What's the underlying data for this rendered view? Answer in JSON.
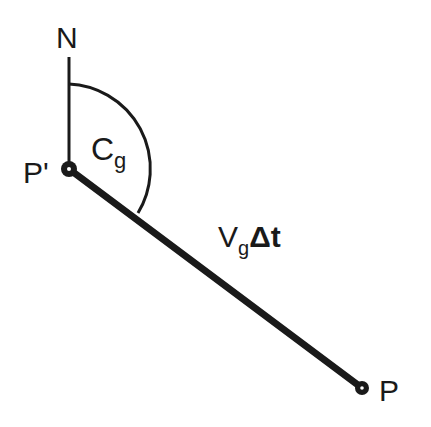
{
  "diagram": {
    "north_label": "N",
    "start_point_label": "P'",
    "end_point_label": "P",
    "angle_label": {
      "main": "C",
      "subscript": "g"
    },
    "segment_label": {
      "main": "V",
      "subscript": "g",
      "suffix": "Δt"
    },
    "colors": {
      "ink": "#1a1a1a",
      "background": "#ffffff"
    }
  }
}
